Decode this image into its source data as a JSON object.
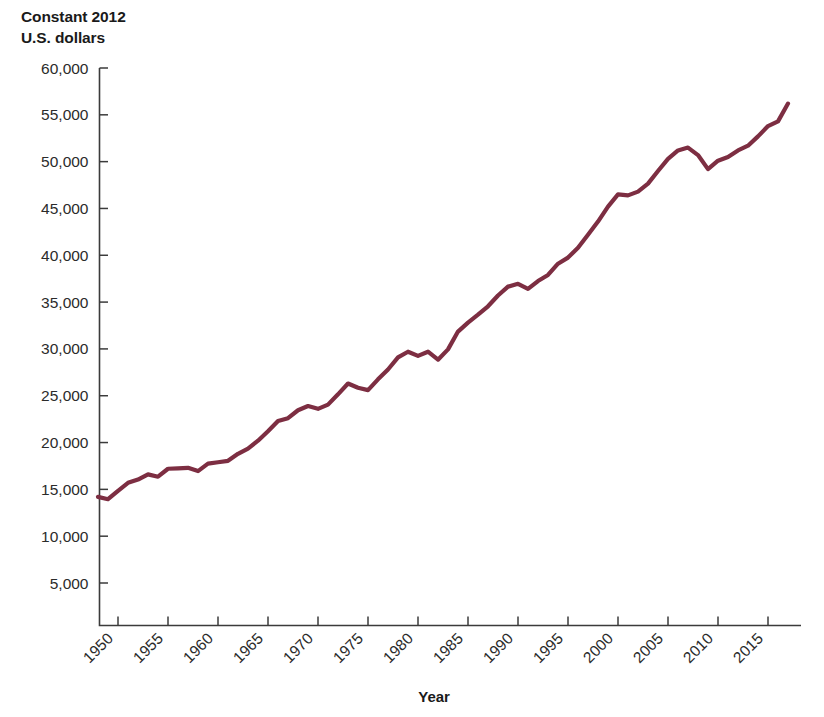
{
  "chart_data": {
    "type": "line",
    "title_line1": "Constant 2012",
    "title_line2": "U.S. dollars",
    "xlabel": "Year",
    "ylabel": "Constant 2012 U.S. dollars",
    "xlim": [
      1948,
      2017
    ],
    "ylim": [
      0,
      60000
    ],
    "grid": false,
    "legend": "none",
    "line_color": "#7d2e42",
    "axis_color": "#3b3b3b",
    "y_ticks": [
      5000,
      10000,
      15000,
      20000,
      25000,
      30000,
      35000,
      40000,
      45000,
      50000,
      55000,
      60000
    ],
    "y_tick_labels": [
      "5,000",
      "10,000",
      "15,000",
      "20,000",
      "25,000",
      "30,000",
      "35,000",
      "40,000",
      "45,000",
      "50,000",
      "55,000",
      "60,000"
    ],
    "x_ticks": [
      1950,
      1955,
      1960,
      1965,
      1970,
      1975,
      1980,
      1985,
      1990,
      1995,
      2000,
      2005,
      2010,
      2015
    ],
    "x_tick_labels": [
      "1950",
      "1955",
      "1960",
      "1965",
      "1970",
      "1975",
      "1980",
      "1985",
      "1990",
      "1995",
      "2000",
      "2005",
      "2010",
      "2015"
    ],
    "x_tick_rotation_deg": 45,
    "series": [
      {
        "name": "Real GDP per capita",
        "x": [
          1948,
          1949,
          1950,
          1951,
          1952,
          1953,
          1954,
          1955,
          1956,
          1957,
          1958,
          1959,
          1960,
          1961,
          1962,
          1963,
          1964,
          1965,
          1966,
          1967,
          1968,
          1969,
          1970,
          1971,
          1972,
          1973,
          1974,
          1975,
          1976,
          1977,
          1978,
          1979,
          1980,
          1981,
          1982,
          1983,
          1984,
          1985,
          1986,
          1987,
          1988,
          1989,
          1990,
          1991,
          1992,
          1993,
          1994,
          1995,
          1996,
          1997,
          1998,
          1999,
          2000,
          2001,
          2002,
          2003,
          2004,
          2005,
          2006,
          2007,
          2008,
          2009,
          2010,
          2011,
          2012,
          2013,
          2014,
          2015,
          2016,
          2017
        ],
        "values": [
          14200,
          13950,
          14850,
          15700,
          16050,
          16600,
          16350,
          17200,
          17250,
          17300,
          16950,
          17750,
          17900,
          18050,
          18800,
          19350,
          20200,
          21200,
          22300,
          22600,
          23450,
          23900,
          23600,
          24050,
          25150,
          26300,
          25850,
          25600,
          26750,
          27800,
          29100,
          29700,
          29250,
          29700,
          28850,
          29950,
          31850,
          32800,
          33650,
          34550,
          35700,
          36650,
          36950,
          36400,
          37250,
          37900,
          39100,
          39750,
          40800,
          42200,
          43600,
          45200,
          46500,
          46400,
          46800,
          47650,
          49000,
          50300,
          51200,
          51500,
          50700,
          49200,
          50100,
          50500,
          51200,
          51700,
          52700,
          53800,
          54300,
          56200
        ]
      }
    ]
  }
}
